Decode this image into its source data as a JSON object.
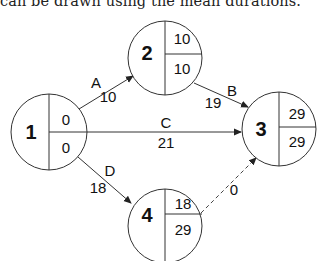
{
  "caption": "can be drawn using the mean durations.",
  "nodes": [
    {
      "id": "1",
      "label": "1",
      "top": "0",
      "bottom": "0",
      "cx": 49,
      "cy": 132,
      "r": 38
    },
    {
      "id": "2",
      "label": "2",
      "top": "10",
      "bottom": "10",
      "cx": 165,
      "cy": 58,
      "r": 37
    },
    {
      "id": "3",
      "label": "3",
      "top": "29",
      "bottom": "29",
      "cx": 279,
      "cy": 129,
      "r": 37
    },
    {
      "id": "4",
      "label": "4",
      "top": "18",
      "bottom": "29",
      "cx": 165,
      "cy": 226,
      "r": 37
    }
  ],
  "edges": [
    {
      "id": "A",
      "from": "1",
      "to": "2",
      "activity": "A",
      "duration": "10",
      "style": "solid"
    },
    {
      "id": "B",
      "from": "2",
      "to": "3",
      "activity": "B",
      "duration": "19",
      "style": "solid"
    },
    {
      "id": "C",
      "from": "1",
      "to": "3",
      "activity": "C",
      "duration": "21",
      "style": "solid"
    },
    {
      "id": "D",
      "from": "1",
      "to": "4",
      "activity": "D",
      "duration": "18",
      "style": "solid"
    },
    {
      "id": "dummy",
      "from": "4",
      "to": "3",
      "activity": "",
      "duration": "0",
      "style": "dashed"
    }
  ],
  "colors": {
    "line": "#333333",
    "text": "#111111",
    "background": "#ffffff"
  }
}
